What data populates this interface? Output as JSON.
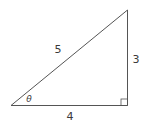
{
  "diagram": {
    "type": "right-triangle",
    "labels": {
      "hypotenuse": "5",
      "vertical_side": "3",
      "horizontal_side": "4",
      "angle": "θ"
    },
    "right_angle_marker": true,
    "stroke_color": "#555555"
  }
}
